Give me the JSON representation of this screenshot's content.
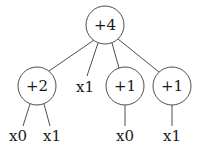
{
  "diagram": {
    "type": "tree",
    "nodes": [
      {
        "id": "root",
        "label": "+4",
        "shape": "circle",
        "cx": 105,
        "cy": 25,
        "r": 19
      },
      {
        "id": "n_plus2",
        "label": "+2",
        "shape": "circle",
        "cx": 37,
        "cy": 86,
        "r": 19
      },
      {
        "id": "n_x1_mid",
        "label": "x1",
        "shape": "text",
        "cx": 85,
        "cy": 87
      },
      {
        "id": "n_plus1_a",
        "label": "+1",
        "shape": "circle",
        "cx": 125,
        "cy": 86,
        "r": 19
      },
      {
        "id": "n_plus1_b",
        "label": "+1",
        "shape": "circle",
        "cx": 172,
        "cy": 86,
        "r": 19
      },
      {
        "id": "leaf_x0_a",
        "label": "x0",
        "shape": "text",
        "cx": 18,
        "cy": 136
      },
      {
        "id": "leaf_x1_a",
        "label": "x1",
        "shape": "text",
        "cx": 52,
        "cy": 136
      },
      {
        "id": "leaf_x0_b",
        "label": "x0",
        "shape": "text",
        "cx": 125,
        "cy": 136
      },
      {
        "id": "leaf_x1_b",
        "label": "x1",
        "shape": "text",
        "cx": 172,
        "cy": 136
      }
    ],
    "edges": [
      {
        "from": "root",
        "to": "n_plus2",
        "x1": 94,
        "y1": 40,
        "x2": 49,
        "y2": 71
      },
      {
        "from": "root",
        "to": "n_x1_mid",
        "x1": 98,
        "y1": 43,
        "x2": 87,
        "y2": 76
      },
      {
        "from": "root",
        "to": "n_plus1_a",
        "x1": 112,
        "y1": 43,
        "x2": 119,
        "y2": 68
      },
      {
        "from": "root",
        "to": "n_plus1_b",
        "x1": 118,
        "y1": 39,
        "x2": 159,
        "y2": 72
      },
      {
        "from": "n_plus2",
        "to": "leaf_x0_a",
        "x1": 30,
        "y1": 104,
        "x2": 23,
        "y2": 126
      },
      {
        "from": "n_plus2",
        "to": "leaf_x1_a",
        "x1": 44,
        "y1": 104,
        "x2": 50,
        "y2": 126
      },
      {
        "from": "n_plus1_a",
        "to": "leaf_x0_b",
        "x1": 125,
        "y1": 105,
        "x2": 125,
        "y2": 126
      },
      {
        "from": "n_plus1_b",
        "to": "leaf_x1_b",
        "x1": 172,
        "y1": 105,
        "x2": 172,
        "y2": 126
      }
    ]
  }
}
